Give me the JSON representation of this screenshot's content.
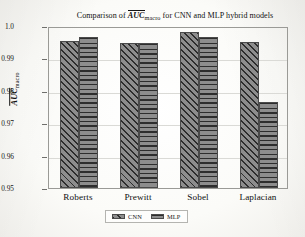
{
  "chart_data": {
    "type": "bar",
    "title_parts": {
      "lead": "Comparison of ",
      "overline_symbol": "AUC",
      "subscript": "macro",
      "trail": " for CNN and MLP hybrid models"
    },
    "categories": [
      "Roberts",
      "Prewitt",
      "Sobel",
      "Laplacian"
    ],
    "series": [
      {
        "name": "CNN",
        "values": [
          0.9955,
          0.9948,
          0.998,
          0.9952
        ],
        "hatch": "diagonal",
        "color": "#8d8d8d"
      },
      {
        "name": "MLP",
        "values": [
          0.9967,
          0.9948,
          0.9965,
          0.9765
        ],
        "hatch": "horizontal",
        "color": "#8d8d8d"
      }
    ],
    "xlabel": "",
    "ylabel": "AUC_macro",
    "ylabel_parts": {
      "overline_symbol": "AUC",
      "subscript": "macro"
    },
    "ylim": [
      0.95,
      1.0
    ],
    "yticks": [
      "0.95",
      "0.96",
      "0.97",
      "0.98",
      "0.99",
      "1.0"
    ],
    "ytick_values": [
      0.95,
      0.96,
      0.97,
      0.98,
      0.99,
      1.0
    ],
    "grid": true,
    "legend_position": "below-axis-center",
    "legend": [
      "CNN",
      "MLP"
    ]
  }
}
